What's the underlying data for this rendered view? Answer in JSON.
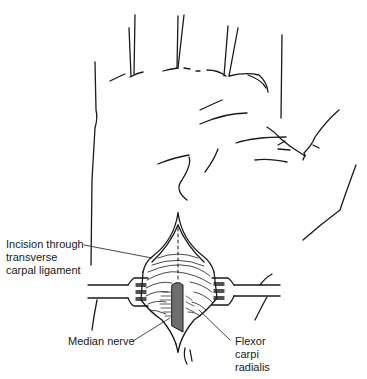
{
  "figure": {
    "stroke_color": "#1a1a1a",
    "nerve_fill": "#6e6e6e",
    "background": "#ffffff"
  },
  "labels": {
    "incision": {
      "line1": "Incision through",
      "line2": "transverse",
      "line3": "carpal ligament"
    },
    "median_nerve": "Median nerve",
    "flexor": {
      "line1": "Flexor",
      "line2": "carpi",
      "line3": "radialis"
    }
  }
}
